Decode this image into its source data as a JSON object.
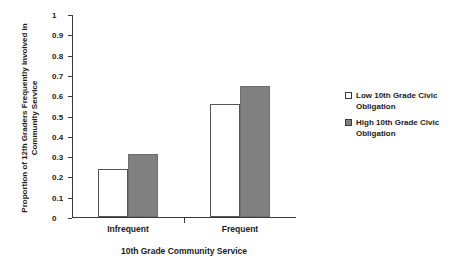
{
  "chart_data": {
    "type": "bar",
    "title": "",
    "xlabel": "10th Grade Community Service",
    "ylabel_line1": "Proportion of 12th Graders Frequently",
    "ylabel_line2": "Involved in Community Service",
    "categories": [
      "Infrequent",
      "Frequent"
    ],
    "series": [
      {
        "name": "Low 10th Grade Civic Obligation",
        "color": "#ffffff",
        "values": [
          0.235,
          0.555
        ]
      },
      {
        "name": "High 10th Grade Civic Obligation",
        "color": "#808080",
        "values": [
          0.31,
          0.645
        ]
      }
    ],
    "ylim": [
      0,
      1
    ],
    "ytick_labels": [
      "0",
      "0.1",
      "0.2",
      "0.3",
      "0.4",
      "0.5",
      "0.6",
      "0.7",
      "0.8",
      "0.9",
      "1"
    ],
    "ytick_values": [
      0,
      0.1,
      0.2,
      0.3,
      0.4,
      0.5,
      0.6,
      0.7,
      0.8,
      0.9,
      1
    ],
    "grid": false,
    "legend_position": "right"
  },
  "legend": {
    "items": [
      {
        "label_line1": "Low 10th Grade Civic",
        "label_line2": "Obligation",
        "swatch": "hollow-square-icon"
      },
      {
        "label_line1": "High 10th Grade Civic",
        "label_line2": "Obligation",
        "swatch": "filled-square-icon"
      }
    ]
  }
}
